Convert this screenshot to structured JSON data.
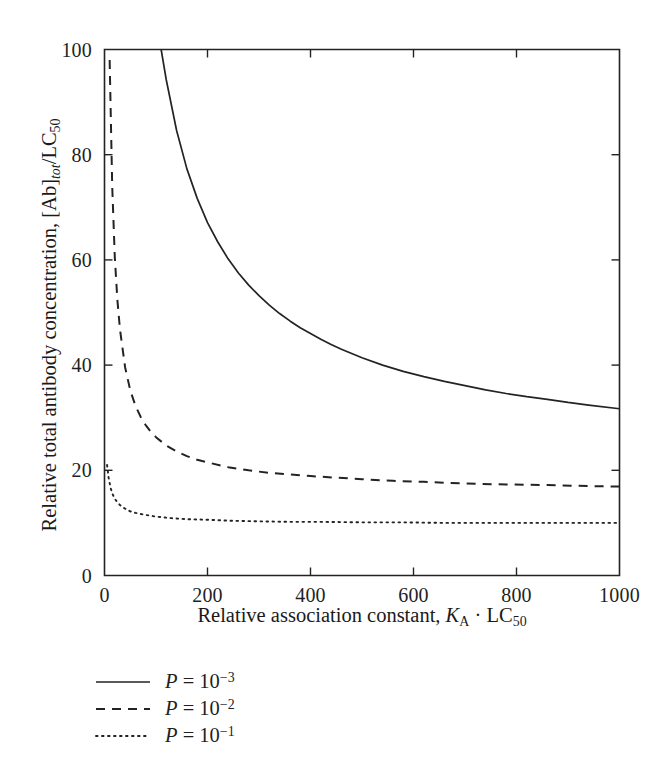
{
  "chart_data": {
    "type": "line",
    "title": "",
    "xlabel": "Relative association constant, K_A · LC_50",
    "ylabel": "Relative total antibody concentration, [Ab]_tot/LC_50",
    "xlim": [
      0,
      1000
    ],
    "ylim": [
      0,
      100
    ],
    "xticks": [
      0,
      200,
      400,
      600,
      800,
      1000
    ],
    "yticks": [
      0,
      20,
      40,
      60,
      80,
      100
    ],
    "xtick_labels": [
      "0",
      "200",
      "400",
      "600",
      "800",
      "1000"
    ],
    "ytick_labels": [
      "0",
      "20",
      "40",
      "60",
      "80",
      "100"
    ],
    "grid": false,
    "legend_position": "below-axes-left",
    "frame": "box",
    "tick_direction": "in",
    "series": [
      {
        "name": "P = 10^-3",
        "label_base": "P = 10",
        "label_exponent": "−3",
        "linestyle": "solid",
        "color": "#232323",
        "x": [
          110,
          120,
          140,
          160,
          180,
          200,
          220,
          240,
          260,
          280,
          300,
          320,
          340,
          360,
          380,
          400,
          420,
          440,
          460,
          480,
          500,
          540,
          580,
          620,
          660,
          700,
          740,
          780,
          820,
          860,
          900,
          940,
          1000
        ],
        "y": [
          100.0,
          94.2,
          84.6,
          77.3,
          71.7,
          67.1,
          63.4,
          60.2,
          57.5,
          55.2,
          53.2,
          51.4,
          49.8,
          48.4,
          47.1,
          46.0,
          44.9,
          43.9,
          43.0,
          42.2,
          41.4,
          40.0,
          38.8,
          37.8,
          36.9,
          36.1,
          35.3,
          34.6,
          34.0,
          33.5,
          32.9,
          32.4,
          31.7
        ]
      },
      {
        "name": "P = 10^-2",
        "label_base": "P = 10",
        "label_exponent": "−2",
        "linestyle": "dashed",
        "color": "#232323",
        "x": [
          10,
          15,
          20,
          25,
          30,
          40,
          50,
          60,
          70,
          80,
          90,
          100,
          120,
          140,
          160,
          180,
          200,
          240,
          280,
          320,
          360,
          400,
          450,
          500,
          560,
          620,
          700,
          780,
          860,
          940,
          1000
        ],
        "y": [
          98.0,
          74.0,
          60.5,
          52.4,
          46.8,
          39.6,
          35.2,
          32.3,
          30.2,
          28.6,
          27.3,
          26.3,
          24.7,
          23.6,
          22.7,
          22.0,
          21.5,
          20.6,
          20.0,
          19.5,
          19.2,
          18.9,
          18.6,
          18.3,
          18.0,
          17.8,
          17.5,
          17.3,
          17.2,
          17.0,
          16.9
        ]
      },
      {
        "name": "P = 10^-1",
        "label_base": "P = 10",
        "label_exponent": "−1",
        "linestyle": "dotted",
        "color": "#232323",
        "x": [
          5,
          8,
          12,
          16,
          20,
          25,
          30,
          40,
          50,
          60,
          80,
          100,
          130,
          160,
          200,
          250,
          300,
          360,
          420,
          500,
          580,
          660,
          740,
          820,
          900,
          1000
        ],
        "y": [
          21.0,
          18.6,
          16.6,
          15.4,
          14.6,
          13.9,
          13.4,
          12.7,
          12.2,
          11.9,
          11.5,
          11.2,
          10.9,
          10.7,
          10.6,
          10.4,
          10.3,
          10.2,
          10.2,
          10.1,
          10.1,
          10.0,
          10.0,
          10.0,
          10.0,
          10.0
        ]
      }
    ]
  },
  "axes": {
    "ylabel_parts": {
      "prefix": "Relative total antibody concentration, [Ab]",
      "sub1": "tot",
      "mid": "/LC",
      "sub2": "50"
    },
    "xlabel_parts": {
      "prefix": "Relative association constant, ",
      "var1": "K",
      "sub1": "A",
      "mid": " · LC",
      "sub2": "50"
    }
  },
  "legend": {
    "entries": [
      {
        "var": "P",
        "eq": " = 10",
        "exp": "−3",
        "style": "solid"
      },
      {
        "var": "P",
        "eq": " = 10",
        "exp": "−2",
        "style": "dashed"
      },
      {
        "var": "P",
        "eq": " = 10",
        "exp": "−1",
        "style": "dotted"
      }
    ]
  },
  "colors": {
    "ink": "#232323",
    "background": "#ffffff"
  }
}
